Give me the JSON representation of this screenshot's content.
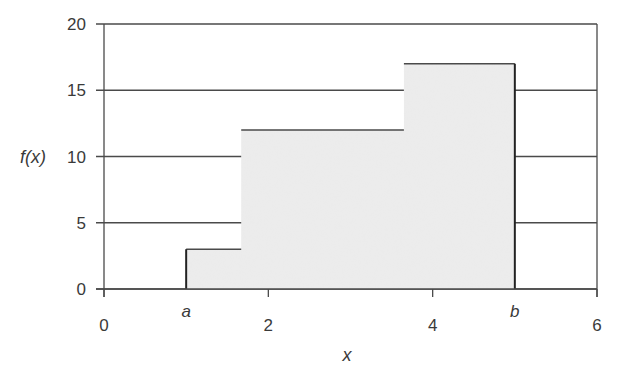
{
  "chart_data": {
    "type": "area",
    "subtype": "step-function",
    "title": "",
    "xlabel": "x",
    "ylabel": "f(x)",
    "xlim": [
      0,
      6
    ],
    "ylim": [
      0,
      20
    ],
    "x_ticks": [
      {
        "value": 0,
        "label": "0"
      },
      {
        "value": 2,
        "label": "2"
      },
      {
        "value": 4,
        "label": "4"
      },
      {
        "value": 6,
        "label": "6"
      }
    ],
    "x_annotations": [
      {
        "value": 1.0,
        "label": "a"
      },
      {
        "value": 5.0,
        "label": "b"
      }
    ],
    "y_ticks": [
      {
        "value": 0,
        "label": "0"
      },
      {
        "value": 5,
        "label": "5"
      },
      {
        "value": 10,
        "label": "10"
      },
      {
        "value": 15,
        "label": "15"
      },
      {
        "value": 20,
        "label": "20"
      }
    ],
    "grid": {
      "horizontal": true,
      "vertical": false
    },
    "legend": null,
    "steps": [
      {
        "x_start": 1.0,
        "x_end": 1.67,
        "value": 3
      },
      {
        "x_start": 1.67,
        "x_end": 3.65,
        "value": 12
      },
      {
        "x_start": 3.65,
        "x_end": 5.0,
        "value": 17
      }
    ],
    "fill_color": "#ececec",
    "line_color": "#4a4a4a",
    "edge_color": "#222222"
  }
}
